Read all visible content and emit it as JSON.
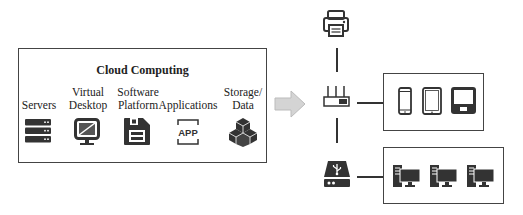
{
  "cloud": {
    "title": "Cloud Computing",
    "services": [
      {
        "label": "Servers",
        "icon": "server-stack-icon"
      },
      {
        "label": "Virtual\nDesktop",
        "line1": "Virtual",
        "line2": "Desktop",
        "icon": "monitor-icon"
      },
      {
        "label": "Software\nPlatform",
        "line1": "Software",
        "line2": "Platform",
        "icon": "floppy-disk-icon"
      },
      {
        "label": "Applications",
        "icon": "app-icon",
        "icon_text": "APP"
      },
      {
        "label": "Storage/\nData",
        "line1": "Storage/",
        "line2": "Data",
        "icon": "cube-cluster-icon"
      }
    ]
  },
  "arrow": {
    "icon": "right-arrow-icon",
    "color": "#d4d4d4"
  },
  "network": {
    "printer": {
      "icon": "printer-icon"
    },
    "router": {
      "icon": "router-icon"
    },
    "usb_storage": {
      "icon": "usb-drive-icon"
    },
    "mobile_devices": [
      {
        "icon": "smartphone-icon"
      },
      {
        "icon": "tablet-icon"
      },
      {
        "icon": "laptop-icon"
      }
    ],
    "workstations": [
      {
        "icon": "desktop-computer-icon"
      },
      {
        "icon": "desktop-computer-icon"
      },
      {
        "icon": "desktop-computer-icon"
      }
    ]
  },
  "colors": {
    "icon": "#333333",
    "border": "#444444",
    "arrow": "#d4d4d4"
  }
}
